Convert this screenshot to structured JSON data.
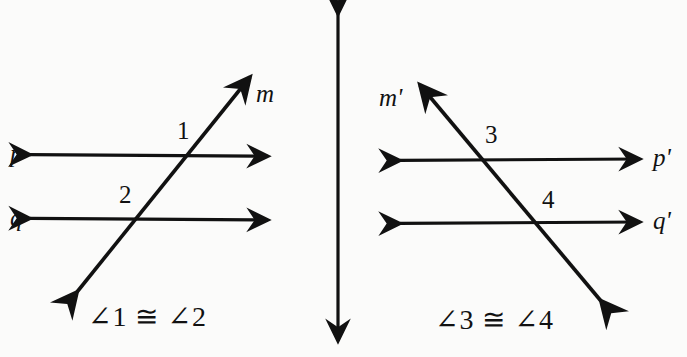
{
  "figure": {
    "background_color": "#fbfbfa",
    "stroke_color": "#111111"
  },
  "left_diagram": {
    "name": "angles-1-and-2",
    "line_labels": {
      "transversal": "m",
      "upper_parallel": "p",
      "lower_parallel": "q"
    },
    "angle_labels": {
      "upper": "1",
      "lower": "2"
    },
    "caption": "∠1 ≅ ∠2",
    "geometry": {
      "upper_parallel": {
        "x1": 30,
        "y1": 154,
        "x2": 268,
        "y2": 156
      },
      "lower_parallel": {
        "x1": 30,
        "y1": 218,
        "x2": 268,
        "y2": 220
      },
      "transversal": {
        "x1": 77,
        "y1": 292,
        "x2": 250,
        "y2": 77
      }
    }
  },
  "center_arrow": {
    "name": "vertical-double-arrow",
    "geometry": {
      "x1": 338,
      "y1": 13,
      "x2": 338,
      "y2": 342
    }
  },
  "right_diagram": {
    "name": "angles-3-and-4",
    "line_labels": {
      "transversal": "m'",
      "upper_parallel": "p'",
      "lower_parallel": "q'"
    },
    "angle_labels": {
      "upper": "3",
      "lower": "4"
    },
    "caption": "∠3 ≅ ∠4",
    "geometry": {
      "upper_parallel": {
        "x1": 400,
        "y1": 160,
        "x2": 640,
        "y2": 159
      },
      "lower_parallel": {
        "x1": 400,
        "y1": 223,
        "x2": 640,
        "y2": 222
      },
      "transversal": {
        "x1": 420,
        "y1": 85,
        "x2": 601,
        "y2": 301
      }
    }
  }
}
